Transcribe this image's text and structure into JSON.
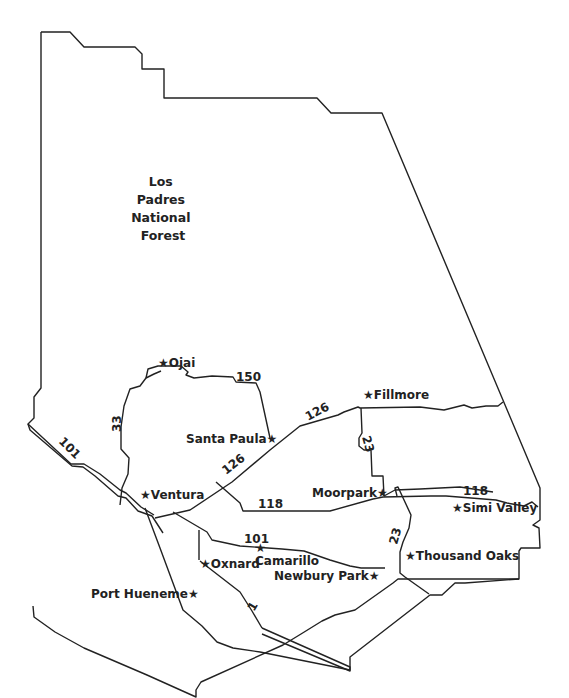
{
  "map": {
    "title": "Ventura County",
    "colors": {
      "line": "#222222",
      "background": "#ffffff"
    },
    "regions": [
      {
        "id": "los-padres",
        "lines": [
          "Los",
          "Padres",
          "National",
          "Forest"
        ]
      }
    ],
    "cities": [
      {
        "id": "ojai",
        "label": "★Ojai"
      },
      {
        "id": "fillmore",
        "label": "★Fillmore"
      },
      {
        "id": "santa-paula",
        "label": "Santa Paula★"
      },
      {
        "id": "ventura",
        "label": "★Ventura"
      },
      {
        "id": "moorpark",
        "label": "Moorpark★"
      },
      {
        "id": "simi-valley",
        "label": "★Simi Valley"
      },
      {
        "id": "camarillo-star",
        "label": "★"
      },
      {
        "id": "camarillo",
        "label": "Camarillo"
      },
      {
        "id": "oxnard",
        "label": "★Oxnard"
      },
      {
        "id": "thousand-oaks",
        "label": "★Thousand Oaks"
      },
      {
        "id": "newbury-park",
        "label": "Newbury Park★"
      },
      {
        "id": "port-hueneme",
        "label": "Port Hueneme★"
      }
    ],
    "highways": [
      {
        "id": "101-coast",
        "label": "101"
      },
      {
        "id": "33",
        "label": "33"
      },
      {
        "id": "150",
        "label": "150"
      },
      {
        "id": "126-north",
        "label": "126"
      },
      {
        "id": "126-south",
        "label": "126"
      },
      {
        "id": "23-north",
        "label": "23"
      },
      {
        "id": "118-west",
        "label": "118"
      },
      {
        "id": "118-east",
        "label": "118"
      },
      {
        "id": "101-inland",
        "label": "101"
      },
      {
        "id": "23-south",
        "label": "23"
      },
      {
        "id": "1",
        "label": "1"
      }
    ]
  }
}
